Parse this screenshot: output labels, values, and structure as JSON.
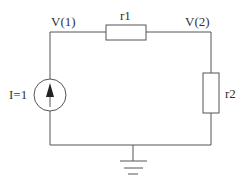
{
  "diagram": {
    "type": "circuit",
    "nodes": {
      "node1": {
        "label": "V(1)"
      },
      "node2": {
        "label": "V(2)"
      }
    },
    "components": {
      "current_source": {
        "label": "I=1",
        "direction": "up"
      },
      "r1": {
        "label": "r1"
      },
      "r2": {
        "label": "r2"
      },
      "ground": {
        "label": ""
      }
    },
    "colors": {
      "line": "#555555",
      "text": "#333333",
      "background": "#ffffff"
    }
  }
}
